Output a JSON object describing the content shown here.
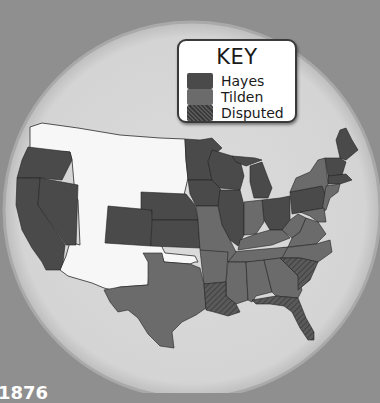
{
  "map": {
    "title": "1876",
    "background_color": "#8f8f8f",
    "disc_color": "#d9d9d9",
    "unvoted_color": "#f7f7f7",
    "colors": {
      "hayes": "#4a4a4a",
      "tilden": "#6b6b6b",
      "disputed": "#555555"
    }
  },
  "key": {
    "title": "KEY",
    "items": [
      {
        "label": "Hayes",
        "type": "hayes"
      },
      {
        "label": "Tilden",
        "type": "tilden"
      },
      {
        "label": "Disputed",
        "type": "disputed"
      }
    ]
  },
  "states": {
    "hayes": [
      "Oregon",
      "California",
      "Nevada",
      "Colorado",
      "Nebraska",
      "Kansas",
      "Minnesota",
      "Iowa",
      "Wisconsin",
      "Michigan",
      "Illinois",
      "Ohio",
      "Pennsylvania",
      "Vermont",
      "Maine",
      "Massachusetts",
      "Rhode Island",
      "New Hampshire"
    ],
    "tilden": [
      "Texas",
      "Missouri",
      "Arkansas",
      "Mississippi",
      "Alabama",
      "Georgia",
      "Tennessee",
      "Kentucky",
      "Indiana",
      "West Virginia",
      "Virginia",
      "North Carolina",
      "New York",
      "New Jersey",
      "Connecticut",
      "Delaware",
      "Maryland"
    ],
    "disputed": [
      "Louisiana",
      "South Carolina",
      "Florida"
    ],
    "territories": [
      "Washington",
      "Idaho",
      "Montana",
      "Wyoming",
      "Utah",
      "Arizona",
      "New Mexico",
      "Dakota",
      "Indian Territory"
    ]
  }
}
